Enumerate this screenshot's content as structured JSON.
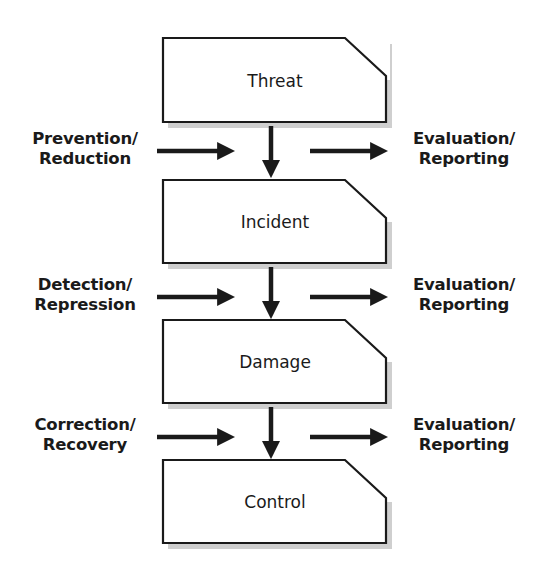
{
  "diagram": {
    "type": "security-incident-cycle",
    "colors": {
      "stroke": "#1a1a1a",
      "box_fill": "#ffffff",
      "shadow": "#c8c8c8",
      "text": "#1a1a1a"
    },
    "stages": [
      {
        "label": "Threat"
      },
      {
        "label": "Incident"
      },
      {
        "label": "Damage"
      },
      {
        "label": "Control"
      }
    ],
    "inputs": [
      {
        "line1": "Prevention/",
        "line2": "Reduction"
      },
      {
        "line1": "Detection/",
        "line2": "Repression"
      },
      {
        "line1": "Correction/",
        "line2": "Recovery"
      }
    ],
    "outputs": [
      {
        "line1": "Evaluation/",
        "line2": "Reporting"
      },
      {
        "line1": "Evaluation/",
        "line2": "Reporting"
      },
      {
        "line1": "Evaluation/",
        "line2": "Reporting"
      }
    ]
  }
}
